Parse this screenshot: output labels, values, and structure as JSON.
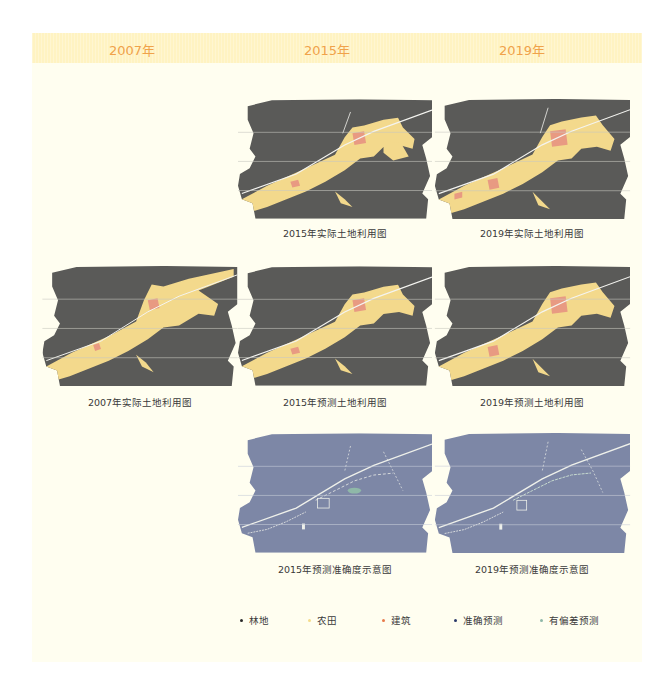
{
  "header": {
    "years": [
      "2007年",
      "2015年",
      "2019年"
    ],
    "background": "#fff3c2",
    "text_color": "#f0a24a"
  },
  "maps": {
    "y2015_actual": {
      "caption": "2015年实际土地利用图",
      "type": "land-use"
    },
    "y2019_actual": {
      "caption": "2019年实际土地利用图",
      "type": "land-use"
    },
    "y2007_actual": {
      "caption": "2007年实际土地利用图",
      "type": "land-use"
    },
    "y2015_predicted": {
      "caption": "2015年预测土地利用图",
      "type": "land-use"
    },
    "y2019_predicted": {
      "caption": "2019年预测土地利用图",
      "type": "land-use"
    },
    "y2015_accuracy": {
      "caption": "2015年预测准确度示意图",
      "type": "accuracy"
    },
    "y2019_accuracy": {
      "caption": "2019年预测准确度示意图",
      "type": "accuracy"
    }
  },
  "legend": {
    "items": [
      {
        "label": "林地",
        "color": "#2a2a2a"
      },
      {
        "label": "农田",
        "color": "#f5dc8a"
      },
      {
        "label": "建筑",
        "color": "#e87a4a"
      },
      {
        "label": "准确预测",
        "color": "#2a3a6a"
      },
      {
        "label": "有偏差预测",
        "color": "#8fb8a8"
      }
    ]
  },
  "colors": {
    "forest": "#5a5a58",
    "farmland": "#f3d98c",
    "building": "#e89a82",
    "accurate": "#7d87a6",
    "deviation": "#e8ece6",
    "panel_bg": "#fffef0"
  }
}
